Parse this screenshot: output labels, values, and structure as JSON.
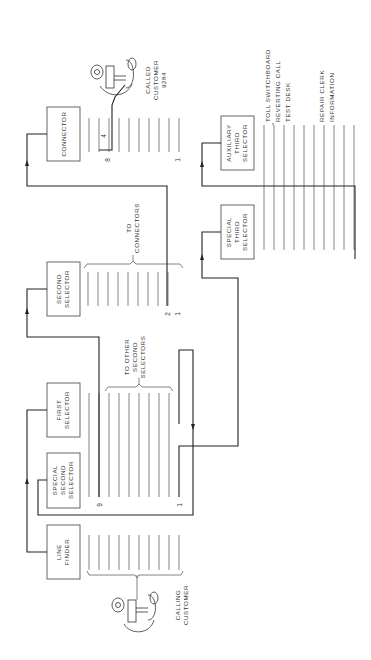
{
  "diagram": {
    "orientation": "rotated-90-ccw",
    "blocks": {
      "line_finder": [
        "LINE",
        "FINDER"
      ],
      "special_second_selector": [
        "SPECIAL",
        "SECOND",
        "SELECTOR"
      ],
      "first_selector": [
        "FIRST",
        "SELECTOR"
      ],
      "second_selector": [
        "SECOND",
        "SELECTOR"
      ],
      "connector": [
        "CONNECTOR"
      ],
      "special_third_selector": [
        "SPECIAL",
        "THIRD",
        "SELECTOR"
      ],
      "auxiliary_third_selector": [
        "AUXILIARY",
        "THIRD",
        "SELECTOR"
      ]
    },
    "annotations": {
      "calling_customer": [
        "CALLING",
        "CUSTOMER"
      ],
      "called_customer": [
        "CALLED",
        "CUSTOMER",
        "9284"
      ],
      "to_other_second_selectors": [
        "TO OTHER",
        "SECOND",
        "SELECTORS"
      ],
      "to_connectors": [
        "TO",
        "CONNECTORS"
      ],
      "toll_switchboard": "TOLL SWITCHBOARD",
      "reverting_call": "REVERTING CALL",
      "test_desk": "TEST DESK",
      "repair_clerk": "REPAIR CLERK",
      "information": "INFORMATION"
    },
    "level_numbers": {
      "first_selector_9": "9",
      "first_selector_1": "1",
      "second_selector_2": "2",
      "second_selector_1": "1",
      "connector_8": "8",
      "connector_4": "4",
      "connector_1": "1"
    }
  }
}
